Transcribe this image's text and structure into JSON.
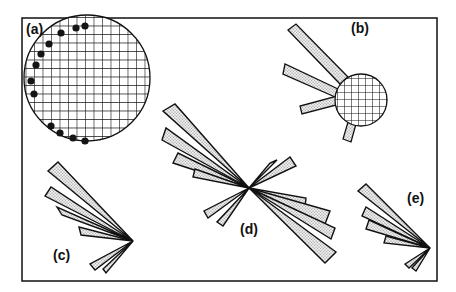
{
  "figure": {
    "frame": {
      "x": 22,
      "y": 18,
      "w": 415,
      "h": 263
    },
    "colors": {
      "stroke": "#111111",
      "fill": "#e6e6e6",
      "dot": "#222222",
      "bg": "#ffffff"
    },
    "panels": [
      {
        "id": "a",
        "label": "(a)",
        "label_pos": [
          27,
          36
        ],
        "kind": "grain-with-dots",
        "circle": {
          "cx": 87,
          "cy": 78,
          "r": 63
        }
      },
      {
        "id": "b",
        "label": "(b)",
        "label_pos": [
          352,
          34
        ],
        "kind": "grain-with-rays",
        "circle": {
          "cx": 361,
          "cy": 100,
          "r": 26
        }
      },
      {
        "id": "c",
        "label": "(c)",
        "label_pos": [
          54,
          262
        ],
        "kind": "rose",
        "center": [
          133,
          241
        ]
      },
      {
        "id": "d",
        "label": "(d)",
        "label_pos": [
          241,
          237
        ],
        "kind": "rose",
        "center": [
          249,
          188
        ]
      },
      {
        "id": "e",
        "label": "(e)",
        "label_pos": [
          408,
          205
        ],
        "kind": "rose",
        "center": [
          430,
          248
        ]
      }
    ]
  }
}
